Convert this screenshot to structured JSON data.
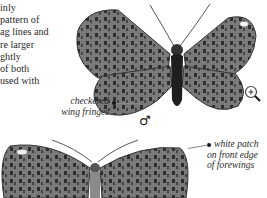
{
  "body_text": {
    "lines": [
      "inly",
      "pattern of",
      "ag lines and",
      "re larger",
      "ghtly",
      "of both",
      "used with"
    ]
  },
  "callouts": {
    "checkered": {
      "line1": "checkered",
      "line2": "wing fringes"
    },
    "white_patch": {
      "line1": "white patch",
      "line2": "on front edge",
      "line3": "of forewings"
    }
  },
  "male_symbol": "♂",
  "colors": {
    "wing": "#6e6e6e",
    "wing_dark": "#3a3a3a",
    "body": "#1e1e1e"
  }
}
